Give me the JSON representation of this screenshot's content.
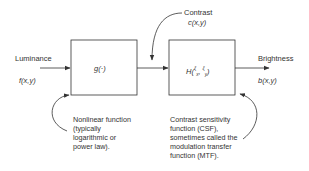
{
  "diagram": {
    "input": {
      "label": "Luminance",
      "symbol": "f(x,y)"
    },
    "block1": {
      "function": "g(·)",
      "annotation": [
        "Nonlinear function",
        "(typically",
        "logarithmic or",
        "power law)."
      ]
    },
    "contrast": {
      "label": "Contrast",
      "symbol": "c(x,y)"
    },
    "block2": {
      "function_main": "H(",
      "sub1": "ξ",
      "sub1b": "x",
      "sep": ", ",
      "sub2": "ξ",
      "sub2b": "y",
      "close": ")",
      "annotation": [
        "Contrast sensitivity",
        "function (CSF),",
        "sometimes called the",
        "modulation transfer",
        "function (MTF)."
      ]
    },
    "output": {
      "label": "Brightness",
      "symbol": "b(x,y)"
    }
  }
}
